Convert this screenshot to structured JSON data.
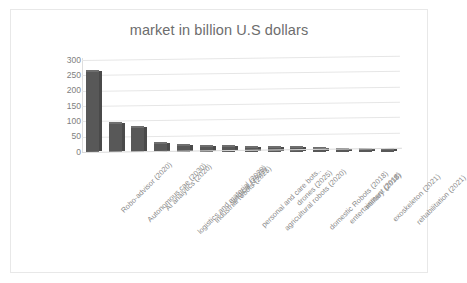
{
  "chart_data": {
    "type": "bar",
    "title": "market in billion U.S dollars",
    "xlabel": "",
    "ylabel": "",
    "ylim": [
      0,
      300
    ],
    "yticks": [
      300,
      250,
      200,
      150,
      100,
      50,
      0
    ],
    "grid": true,
    "legend": false,
    "bar_color": "#585858",
    "categories": [
      "Robo-advisor (2020)",
      "Autonomous cae (2030)",
      "AI analytics (2020)",
      "logistics and material (2020)",
      "industrial robots (2025)",
      "surgical (2022)",
      "personal and care bots..",
      "agricultural robots (2020)",
      "drones (2025)",
      "domestic Robots (2018)",
      "entertainment (2018)",
      "military (2018)",
      "exoskeleton (2021)",
      "rehabilitation (2021)"
    ],
    "values": [
      260,
      90,
      78,
      25,
      20,
      16,
      15,
      14,
      13,
      12,
      10,
      8,
      4,
      3
    ]
  }
}
